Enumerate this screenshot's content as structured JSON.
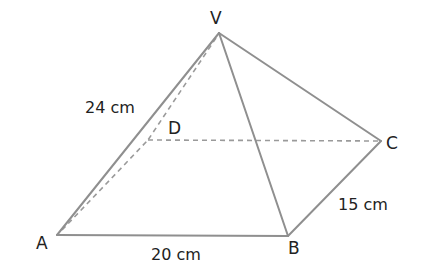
{
  "diagram": {
    "type": "square-based pyramid (rectangular base)",
    "vertices": {
      "V": {
        "label": "V",
        "x": 219,
        "y": 33
      },
      "A": {
        "label": "A",
        "x": 57,
        "y": 235
      },
      "B": {
        "label": "B",
        "x": 288,
        "y": 236
      },
      "C": {
        "label": "C",
        "x": 381,
        "y": 141
      },
      "D": {
        "label": "D",
        "x": 148,
        "y": 140
      }
    },
    "visible_edges": [
      "VA",
      "VB",
      "VC",
      "AB",
      "BC"
    ],
    "hidden_edges": [
      "VD",
      "AD",
      "DC"
    ],
    "measurements": {
      "VA": "24 cm",
      "AB": "20 cm",
      "BC": "15 cm"
    },
    "colors": {
      "edge": "#8f8f8f",
      "hidden_edge": "#9a9a9a",
      "text": "#222222"
    }
  }
}
